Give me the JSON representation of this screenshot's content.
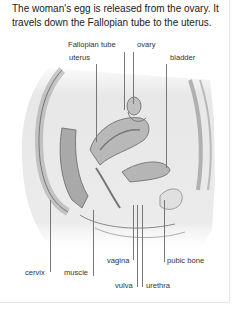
{
  "caption": "The woman's egg is released from the ovary. It travels down the Fallopian tube to the uterus.",
  "labels": {
    "fallopian_tube": "Fallopian tube",
    "ovary": "ovary",
    "uterus": "uterus",
    "bladder": "bladder",
    "cervix": "cervix",
    "muscle": "muscle",
    "vagina": "vagina",
    "pubic_bone": "pubic bone",
    "vulva": "vulva",
    "urethra": "urethra"
  }
}
